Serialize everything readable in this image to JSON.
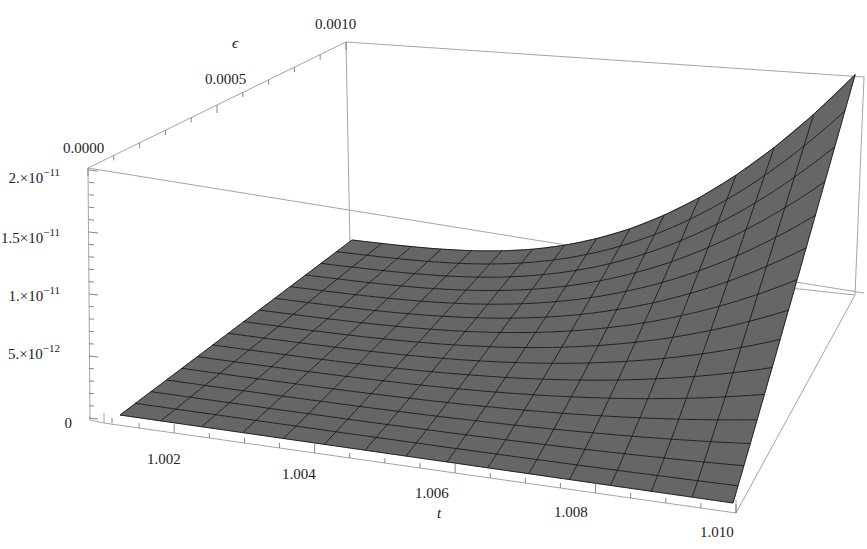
{
  "chart_data": {
    "type": "surface3d",
    "title": "",
    "xlabel": "t",
    "ylabel": "ε",
    "zlabel": "",
    "x_range": [
      1.001,
      1.01
    ],
    "y_range": [
      0.0,
      0.001
    ],
    "z_range": [
      0,
      2e-11
    ],
    "x_ticks": [
      "1.002",
      "1.004",
      "1.006",
      "1.008",
      "1.010"
    ],
    "y_ticks": [
      "0.0000",
      "0.0005",
      "0.0010"
    ],
    "z_ticks": [
      "0",
      "5.×10⁻¹²",
      "1.×10⁻¹¹",
      "1.5×10⁻¹¹",
      "2.×10⁻¹¹"
    ],
    "mesh_divisions": 15,
    "surface_color": "#666666",
    "mesh_color": "#1a1a1a",
    "corner_values": {
      "t1.001_eps0": 0,
      "t1.001_eps0.001": 0,
      "t1.010_eps0": 1e-13,
      "t1.010_eps0.001": 1.7e-11
    },
    "grid": false,
    "legend": null
  },
  "labels": {
    "x_axis": "t",
    "y_axis": "ϵ",
    "x_ticks": [
      {
        "text": "1.002",
        "x": 147,
        "y": 464
      },
      {
        "text": "1.004",
        "x": 282,
        "y": 479
      },
      {
        "text": "1.006",
        "x": 415,
        "y": 498
      },
      {
        "text": "1.008",
        "x": 554,
        "y": 517
      },
      {
        "text": "1.010",
        "x": 700,
        "y": 537
      }
    ],
    "y_ticks": [
      {
        "text": "0.0000",
        "x": 63,
        "y": 153
      },
      {
        "text": "0.0005",
        "x": 205,
        "y": 84
      },
      {
        "text": "0.0010",
        "x": 315,
        "y": 29
      }
    ],
    "z_ticks": [
      {
        "text": "0",
        "x": 72,
        "y": 428,
        "anchor": "end"
      },
      {
        "text": "5.×10",
        "exp": "−12",
        "x": 80,
        "y": 359,
        "anchor": "end"
      },
      {
        "text": "1.×10",
        "exp": "−11",
        "x": 80,
        "y": 301,
        "anchor": "end"
      },
      {
        "text": "1.5×10",
        "exp": "−11",
        "x": 80,
        "y": 243,
        "anchor": "end"
      },
      {
        "text": "2.×10",
        "exp": "−11",
        "x": 80,
        "y": 183,
        "anchor": "end"
      }
    ]
  }
}
